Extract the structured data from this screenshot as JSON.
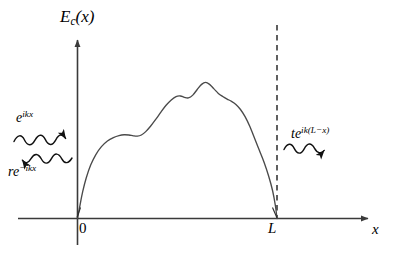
{
  "figure": {
    "background_color": "#ffffff",
    "line_color": "#3a3a3a",
    "curve_color": "#4a4a4a",
    "text_color": "#000000"
  },
  "axes": {
    "y_axis_label_base": "E",
    "y_axis_label_sub": "c",
    "y_axis_label_arg": "(x)",
    "x_axis_label": "x",
    "x_ticks": [
      {
        "name": "origin",
        "label": "0",
        "x_value": 0
      },
      {
        "name": "barrier-end",
        "label": "L",
        "x_value": 1
      }
    ],
    "y_axis_has_arrow": true,
    "x_axis_has_arrow": true
  },
  "annotations": {
    "incident": {
      "base": "e",
      "exponent": "ikx",
      "direction": "right",
      "description": "incident wave"
    },
    "reflected": {
      "base": "re",
      "exponent": "−ikx",
      "direction": "left",
      "description": "reflected wave"
    },
    "transmitted": {
      "base": "te",
      "exponent": "ik(L−x)",
      "direction": "right",
      "description": "transmitted wave"
    },
    "barrier_marker": {
      "name": "dashed-line-at-L",
      "style": "dashed",
      "label": "L"
    }
  },
  "chart_data": {
    "type": "line",
    "title": "",
    "xlabel": "x",
    "ylabel": "E_c(x)",
    "xlim": [
      -0.35,
      1.42
    ],
    "ylim": [
      0,
      1.18
    ],
    "grid": false,
    "legend": null,
    "series": [
      {
        "name": "Ec(x) barrier profile",
        "comment": "Normalized coordinates: x in units of L, y in units of barrier peak height.",
        "x": [
          0.0,
          0.012,
          0.026,
          0.044,
          0.066,
          0.092,
          0.12,
          0.15,
          0.18,
          0.208,
          0.234,
          0.258,
          0.28,
          0.3,
          0.32,
          0.342,
          0.366,
          0.392,
          0.418,
          0.444,
          0.47,
          0.494,
          0.516,
          0.536,
          0.556,
          0.578,
          0.6,
          0.622,
          0.642,
          0.662,
          0.684,
          0.706,
          0.728,
          0.75,
          0.772,
          0.794,
          0.816,
          0.84,
          0.864,
          0.888,
          0.912,
          0.936,
          0.958,
          0.978,
          0.992,
          1.0
        ],
        "y": [
          0.0,
          0.09,
          0.19,
          0.288,
          0.378,
          0.452,
          0.508,
          0.548,
          0.572,
          0.586,
          0.592,
          0.59,
          0.584,
          0.582,
          0.59,
          0.614,
          0.652,
          0.7,
          0.752,
          0.8,
          0.838,
          0.862,
          0.866,
          0.856,
          0.852,
          0.872,
          0.912,
          0.948,
          0.962,
          0.948,
          0.916,
          0.884,
          0.862,
          0.844,
          0.828,
          0.806,
          0.772,
          0.72,
          0.65,
          0.566,
          0.48,
          0.394,
          0.3,
          0.196,
          0.09,
          0.0
        ]
      }
    ],
    "annotations": [
      {
        "name": "incident-wave-arrow",
        "text": "e^{ikx}",
        "direction": "right",
        "region": "x<0"
      },
      {
        "name": "reflected-wave-arrow",
        "text": "re^{-ikx}",
        "direction": "left",
        "region": "x<0"
      },
      {
        "name": "transmitted-wave-arrow",
        "text": "te^{ik(L-x)}",
        "direction": "right",
        "region": "x>L"
      },
      {
        "name": "dashed-line-at-L",
        "text": "L",
        "direction": "vertical",
        "region": "x=L"
      }
    ]
  }
}
